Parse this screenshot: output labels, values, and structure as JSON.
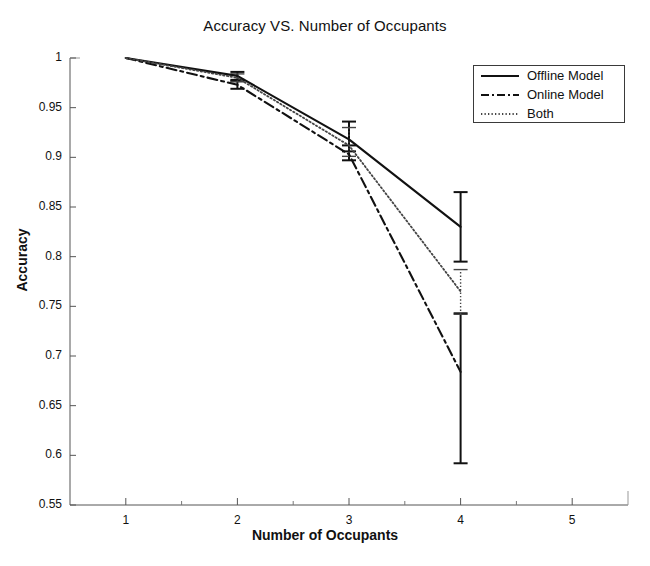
{
  "chart_data": {
    "type": "line",
    "title": "Accuracy VS. Number of Occupants",
    "xlabel": "Number of Occupants",
    "ylabel": "Accuracy",
    "xlim": [
      0.5,
      5.5
    ],
    "ylim": [
      0.55,
      1.0
    ],
    "grid": false,
    "legend_position": "top-right",
    "xticks": [
      "1",
      "2",
      "3",
      "4",
      "5"
    ],
    "xtick_values": [
      1,
      2,
      3,
      4,
      5
    ],
    "xminor_ticks": [
      1.5,
      2.5,
      3.5,
      4.5
    ],
    "yticks": [
      "0.55",
      "0.6",
      "0.65",
      "0.7",
      "0.75",
      "0.8",
      "0.85",
      "0.9",
      "0.95",
      "1"
    ],
    "ytick_values": [
      0.55,
      0.6,
      0.65,
      0.7,
      0.75,
      0.8,
      0.85,
      0.9,
      0.95,
      1.0
    ],
    "x": [
      1,
      2,
      3,
      4
    ],
    "series": [
      {
        "name": "Offline Model",
        "style": "solid",
        "color": "#111111",
        "values": [
          1.0,
          0.982,
          0.918,
          0.83
        ],
        "err_low": [
          1.0,
          0.978,
          0.906,
          0.795
        ],
        "err_high": [
          1.0,
          0.986,
          0.936,
          0.865
        ]
      },
      {
        "name": "Online Model",
        "style": "dashdot",
        "color": "#111111",
        "values": [
          1.0,
          0.973,
          0.903,
          0.684
        ],
        "err_low": [
          1.0,
          0.969,
          0.897,
          0.592
        ],
        "err_high": [
          1.0,
          0.977,
          0.912,
          0.743
        ]
      },
      {
        "name": "Both",
        "style": "dotted",
        "color": "#444444",
        "values": [
          1.0,
          0.98,
          0.912,
          0.765
        ],
        "err_low": [
          1.0,
          0.976,
          0.901,
          0.742
        ],
        "err_high": [
          1.0,
          0.984,
          0.93,
          0.787
        ]
      }
    ]
  },
  "legend": {
    "items": [
      {
        "label": "Offline Model"
      },
      {
        "label": "Online Model"
      },
      {
        "label": "Both"
      }
    ]
  }
}
